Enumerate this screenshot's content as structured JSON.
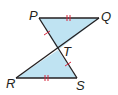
{
  "diagram": {
    "type": "geometry",
    "points": {
      "P": {
        "label": "P",
        "x": 39,
        "y": 18
      },
      "Q": {
        "label": "Q",
        "x": 99,
        "y": 18
      },
      "T": {
        "label": "T",
        "x": 58,
        "y": 50
      },
      "R": {
        "label": "R",
        "x": 16,
        "y": 78
      },
      "S": {
        "label": "S",
        "x": 77,
        "y": 78
      }
    },
    "triangles": [
      {
        "name": "triangle-PQT",
        "vertices": [
          "P",
          "Q",
          "T"
        ]
      },
      {
        "name": "triangle-RST",
        "vertices": [
          "R",
          "S",
          "T"
        ]
      }
    ],
    "congruence_marks": [
      {
        "segment": "PQ",
        "ticks": 2
      },
      {
        "segment": "RS",
        "ticks": 2
      },
      {
        "segment": "PT",
        "ticks": 1
      },
      {
        "segment": "TS",
        "ticks": 1
      }
    ],
    "colors": {
      "fill": "#bfe3f2",
      "stroke": "#231f20",
      "tick": "#d7263d"
    }
  }
}
